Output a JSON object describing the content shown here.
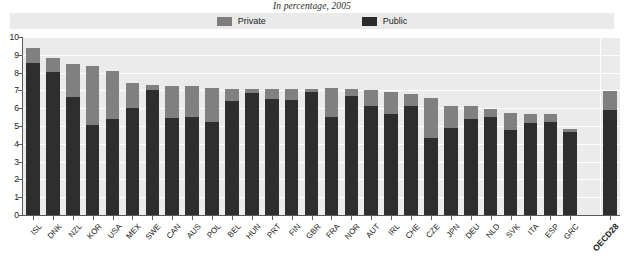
{
  "chart_data": {
    "type": "bar",
    "subtype": "stacked-bar",
    "title": "In percentage, 2005",
    "xlabel": "",
    "ylabel": "",
    "ylim": [
      0,
      10
    ],
    "ytick_step": 1,
    "yticks": [
      "0",
      "1",
      "2",
      "3",
      "4",
      "5",
      "6",
      "7",
      "8",
      "9",
      "10"
    ],
    "grid": true,
    "grid_axis": "y",
    "legend_position": "top-center",
    "legend": [
      {
        "name": "Private",
        "color": "#808080"
      },
      {
        "name": "Public",
        "color": "#2e2e2e"
      }
    ],
    "categories": [
      "ISL",
      "DNK",
      "NZL",
      "KOR",
      "USA",
      "MEX",
      "SWE",
      "CAN",
      "AUS",
      "POL",
      "BEL",
      "HUN",
      "PRT",
      "FIN",
      "GBR",
      "FRA",
      "NOR",
      "AUT",
      "IRL",
      "CHE",
      "CZE",
      "JPN",
      "DEU",
      "NLD",
      "SVK",
      "ITA",
      "ESP",
      "GRC",
      "",
      "OECD28"
    ],
    "highlight_category": "OECD28",
    "series": [
      {
        "name": "Public",
        "color": "#2e2e2e",
        "values": [
          8.55,
          8.05,
          6.65,
          5.05,
          5.4,
          6.0,
          7.05,
          5.45,
          5.5,
          5.25,
          6.4,
          6.85,
          6.5,
          6.45,
          6.9,
          5.5,
          6.7,
          6.1,
          5.7,
          6.15,
          4.3,
          4.9,
          5.4,
          5.5,
          4.8,
          5.15,
          5.25,
          4.65,
          null,
          5.9
        ]
      },
      {
        "name": "Private",
        "color": "#808080",
        "values": [
          0.85,
          0.75,
          1.85,
          3.35,
          2.7,
          1.4,
          0.25,
          1.8,
          1.75,
          1.9,
          0.7,
          0.25,
          0.6,
          0.65,
          0.2,
          1.65,
          0.4,
          0.9,
          1.2,
          0.65,
          2.3,
          1.25,
          0.7,
          0.45,
          0.95,
          0.55,
          0.4,
          0.2,
          null,
          1.05
        ]
      }
    ],
    "totals": [
      9.4,
      8.8,
      8.5,
      8.4,
      8.1,
      7.4,
      7.3,
      7.25,
      7.25,
      7.15,
      7.1,
      7.1,
      7.1,
      7.1,
      7.1,
      7.15,
      7.1,
      7.0,
      6.9,
      6.8,
      6.6,
      6.15,
      6.1,
      5.95,
      5.75,
      5.7,
      5.65,
      4.85,
      null,
      6.95
    ]
  },
  "colors": {
    "plot_background": "#ebebeb",
    "legend_background": "#eaeaea",
    "gridline": "#ffffff",
    "axis": "#5a5a5a",
    "private": "#808080",
    "public": "#2e2e2e",
    "page_background": "#ffffff"
  }
}
